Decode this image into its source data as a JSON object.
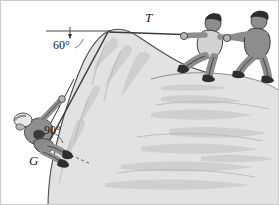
{
  "figure": {
    "kind": "physics-illustration",
    "background_color": "#ffffff",
    "border_color": "#c9c9c9",
    "rock_fill": "#e2e2e2",
    "rock_shade": "#cfcfcf",
    "rock_outline": "#4a4a4a",
    "figure_fill": "#9a9a9a",
    "figure_dark": "#2e2e2e",
    "figure_light": "#c8c8c8",
    "line_color": "#333333"
  },
  "labels": {
    "tension": "T",
    "angle_rope": "60°",
    "angle_body": "90°",
    "weight": "G"
  },
  "annotations": {
    "horizontal_reference": "horizontal dashed reference line at cliff top",
    "rope_arrow": "arrow along rope pointing down toward climber",
    "perpendicular_dash": "short dashed line normal to rock face at climber's feet"
  },
  "actors": {
    "puller_front": "person leaning back pulling rope",
    "puller_back": "person with cap pulling rope",
    "climber": "rock climber with helmet hanging on cliff face"
  }
}
